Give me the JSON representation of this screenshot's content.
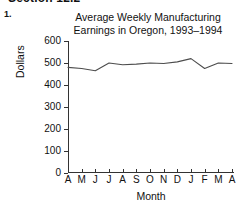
{
  "worksheet": {
    "section_header": "Section 12.2",
    "item_number": "1."
  },
  "chart_data": {
    "type": "line",
    "title": "Average Weekly Manufacturing Earnings in Oregon, 1993–1994",
    "title_line1": "Average Weekly Manufacturing",
    "title_line2": "Earnings in Oregon, 1993–1994",
    "xlabel": "Month",
    "ylabel": "Dollars",
    "categories": [
      "A",
      "M",
      "J",
      "J",
      "A",
      "S",
      "O",
      "N",
      "D",
      "J",
      "F",
      "M",
      "A"
    ],
    "values": [
      480,
      475,
      465,
      500,
      492,
      495,
      500,
      498,
      505,
      520,
      475,
      500,
      498
    ],
    "ylim": [
      0,
      600
    ],
    "yticks": [
      0,
      100,
      200,
      300,
      400,
      500,
      600
    ],
    "ytick_labels": [
      "0",
      "100",
      "200",
      "300",
      "400",
      "500",
      "600"
    ],
    "grid": false,
    "legend": false,
    "line_color": "#4d4d4d",
    "axis_color": "#333333",
    "background": "#ffffff"
  }
}
